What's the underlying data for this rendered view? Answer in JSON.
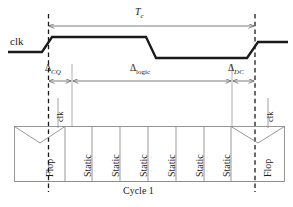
{
  "diagram": {
    "title_symbol": "T",
    "title_subscript": "c",
    "signal_label": "clk",
    "cycle_label": "Cycle 1",
    "intervals": [
      {
        "name": "delta-cq",
        "symbol": "Δ",
        "subscript": "CQ",
        "subscript_style": "italic"
      },
      {
        "name": "delta-logic",
        "symbol": "Δ",
        "subscript": "logic",
        "subscript_style": "roman"
      },
      {
        "name": "delta-dc",
        "symbol": "Δ",
        "subscript": "DC",
        "subscript_style": "italic"
      }
    ],
    "clk_tap_labels": [
      "clk",
      "clk"
    ],
    "blocks": [
      {
        "type": "flop",
        "label": "Flop"
      },
      {
        "type": "static",
        "label": "Static"
      },
      {
        "type": "static",
        "label": "Static"
      },
      {
        "type": "static",
        "label": "Static"
      },
      {
        "type": "static",
        "label": "Static"
      },
      {
        "type": "static",
        "label": "Static"
      },
      {
        "type": "static",
        "label": "Static"
      },
      {
        "type": "flop",
        "label": "Flop"
      }
    ],
    "colors": {
      "waveform": "#1a1a1a",
      "dashed_edge": "#1a1a1a",
      "arrow": "#6d6d6d",
      "box_stroke": "#8c8c8c",
      "background": "#ffffff",
      "text": "#1a1a1a"
    }
  }
}
